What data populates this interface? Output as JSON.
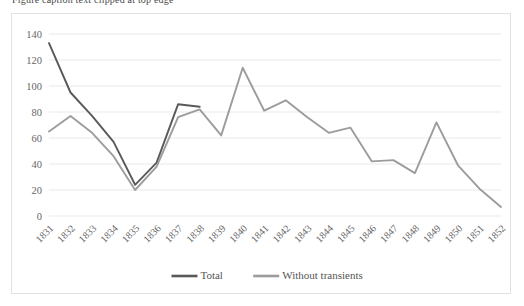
{
  "clipped_title": "Figure caption text clipped at top edge",
  "chart_data": {
    "type": "line",
    "title": "",
    "xlabel": "",
    "ylabel": "",
    "ylim": [
      0,
      140
    ],
    "ytick_values": [
      0,
      20,
      40,
      60,
      80,
      100,
      120,
      140
    ],
    "ytick_labels": [
      "0",
      "20",
      "40",
      "60",
      "80",
      "100",
      "120",
      "140"
    ],
    "grid": true,
    "legend_position": "bottom",
    "categories": [
      "1831",
      "1832",
      "1833",
      "1834",
      "1835",
      "1836",
      "1837",
      "1838",
      "1839",
      "1840",
      "1841",
      "1842",
      "1843",
      "1844",
      "1845",
      "1846",
      "1847",
      "1848",
      "1849",
      "1850",
      "1851",
      "1852"
    ],
    "series": [
      {
        "name": "Total",
        "color": "#595959",
        "values": [
          133,
          95,
          77,
          57,
          24,
          41,
          86,
          84,
          null,
          null,
          null,
          null,
          null,
          null,
          null,
          null,
          null,
          null,
          null,
          null,
          null,
          null
        ]
      },
      {
        "name": "Without transients",
        "color": "#9c9c9c",
        "values": [
          65,
          77,
          64,
          46,
          20,
          38,
          76,
          82,
          62,
          114,
          81,
          89,
          76,
          64,
          68,
          42,
          43,
          33,
          72,
          39,
          21,
          7
        ]
      }
    ]
  },
  "legend": {
    "items": [
      {
        "label": "Total",
        "color": "#595959"
      },
      {
        "label": "Without transients",
        "color": "#9c9c9c"
      }
    ]
  },
  "colors": {
    "total": "#595959",
    "without_transients": "#9c9c9c",
    "grid": "#e9e9e9",
    "frame_border": "#e2e2e2",
    "tick_text": "#666666"
  }
}
